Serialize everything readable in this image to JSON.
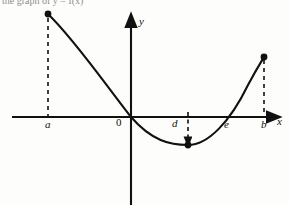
{
  "figure": {
    "type": "math-graph",
    "background_color": "#fdfdfc",
    "stroke_color": "#111111",
    "width": 289,
    "height": 205,
    "cropped_caption_fragment": "the graph of y = f(x)"
  },
  "axes": {
    "x_axis": {
      "label": "x",
      "label_x": 277,
      "label_y": 121,
      "y_pixel": 117,
      "x_start": 12,
      "x_end": 272,
      "arrow": "right"
    },
    "y_axis": {
      "label": "y",
      "label_x": 139,
      "label_y": 21,
      "x_pixel": 131,
      "y_start": 22,
      "y_end": 205,
      "arrow": "up"
    },
    "origin": {
      "label": "0",
      "label_x": 116,
      "label_y": 121,
      "x_pixel": 131,
      "y_pixel": 117
    }
  },
  "tick_labels": [
    {
      "name": "a",
      "label": "a",
      "x": 45,
      "y": 121,
      "axis_x": 48
    },
    {
      "name": "d",
      "label": "d",
      "x": 172,
      "y": 120,
      "axis_x": 188
    },
    {
      "name": "e",
      "label": "e",
      "x": 224,
      "y": 121,
      "axis_x": 227
    },
    {
      "name": "b",
      "label": "b",
      "x": 261,
      "y": 121,
      "axis_x": 264
    }
  ],
  "curve": {
    "description": "Parabola-like curve decreasing from left endpoint through origin to a minimum, then increasing to right endpoint",
    "path": "M 48,14 C 75,40 108,88 131,117 C 152,141 170,145 188,145 C 208,145 230,122 248,85 C 256,70 261,62 264,57",
    "endpoints": [
      {
        "name": "left-endpoint",
        "x": 48,
        "y": 14,
        "at": "a"
      },
      {
        "name": "right-endpoint",
        "x": 264,
        "y": 57,
        "at": "b"
      }
    ],
    "minimum_point": {
      "name": "vertex",
      "x": 188,
      "y": 145,
      "at": "d"
    },
    "x_intercepts": [
      {
        "name": "origin-intercept",
        "x": 131
      },
      {
        "name": "e-intercept",
        "x": 227
      }
    ]
  },
  "dashed_lines": [
    {
      "name": "dashed-a",
      "x": 48,
      "y_from": 18,
      "y_to": 117,
      "arrow": "none"
    },
    {
      "name": "dashed-d",
      "x": 188,
      "y_from": 112,
      "y_to": 141,
      "arrow": "down"
    },
    {
      "name": "dashed-b",
      "x": 264,
      "y_from": 60,
      "y_to": 117,
      "arrow": "none"
    }
  ]
}
